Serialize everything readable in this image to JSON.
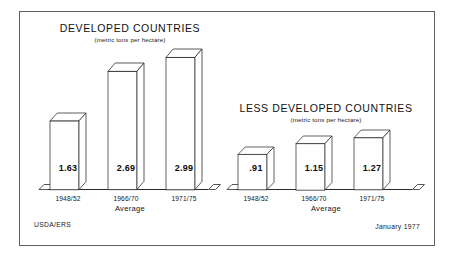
{
  "figure": {
    "source_credit": "USDA/ERS",
    "date_credit": "January 1977"
  },
  "chart_data": [
    {
      "type": "bar",
      "title": "DEVELOPED COUNTRIES",
      "subtitle": "(metric tons per hectare)",
      "xlabel": "Average",
      "ylabel": "",
      "unit": "metric tons per hectare",
      "categories": [
        "1948/52",
        "1966/70",
        "1971/75"
      ],
      "values": [
        1.63,
        2.69,
        2.99
      ],
      "value_labels": [
        "1.63",
        "2.69",
        "2.99"
      ],
      "ylim": [
        0,
        3.1
      ],
      "grid": false,
      "legend": "none",
      "style": "3d-block-bars"
    },
    {
      "type": "bar",
      "title": "LESS DEVELOPED COUNTRIES",
      "subtitle": "(metric tons per hectare)",
      "xlabel": "Average",
      "ylabel": "",
      "unit": "metric tons per hectare",
      "categories": [
        "1948/52",
        "1966/70",
        "1971/75"
      ],
      "values": [
        0.91,
        1.15,
        1.27
      ],
      "value_labels": [
        ".91",
        "1.15",
        "1.27"
      ],
      "ylim": [
        0,
        3.1
      ],
      "grid": false,
      "legend": "none",
      "style": "3d-block-bars"
    }
  ],
  "colors": {
    "frame": "#5e5e5e",
    "bar_outline": "#2b2b2b",
    "bar_face": "#ffffff",
    "text": "#111111",
    "background": "#ffffff"
  }
}
